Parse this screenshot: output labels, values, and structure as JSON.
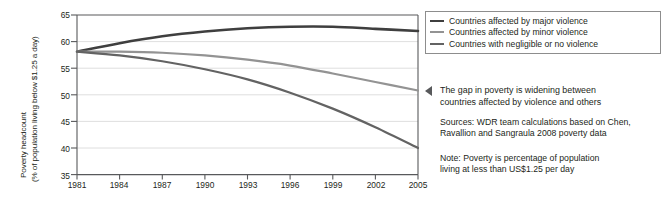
{
  "chart_data": {
    "type": "line",
    "title": "",
    "xlabel": "",
    "ylabel_line1": "Poverty headcount",
    "ylabel_line2": "(% of population living below $1.25 a day)",
    "xlim": [
      1981,
      2005
    ],
    "ylim": [
      35,
      65
    ],
    "grid": true,
    "legend_position": "top-right",
    "xticks": [
      "1981",
      "1984",
      "1987",
      "1990",
      "1993",
      "1996",
      "1999",
      "2002",
      "2005"
    ],
    "yticks": [
      "65",
      "60",
      "55",
      "50",
      "45",
      "40",
      "35"
    ],
    "x": [
      1981,
      1984,
      1987,
      1990,
      1993,
      1996,
      1999,
      2002,
      2005
    ],
    "series": [
      {
        "name": "Countries affected by major violence",
        "color": "#3f3f3f",
        "values": [
          58.1,
          59.7,
          61.0,
          61.9,
          62.5,
          62.8,
          62.8,
          62.4,
          62.0
        ]
      },
      {
        "name": "Countries affected by minor violence",
        "color": "#939393",
        "values": [
          58.1,
          58.1,
          57.9,
          57.4,
          56.6,
          55.5,
          54.0,
          52.4,
          50.8
        ]
      },
      {
        "name": "Countries with negligible or no violence",
        "color": "#636363",
        "values": [
          58.1,
          57.4,
          56.3,
          54.8,
          52.9,
          50.4,
          47.4,
          43.9,
          40.0
        ]
      }
    ]
  },
  "legend": {
    "items": [
      {
        "label": "Countries affected by major violence",
        "color": "#3f3f3f"
      },
      {
        "label": "Countries affected by minor violence",
        "color": "#939393"
      },
      {
        "label": "Countries with negligible or no violence",
        "color": "#636363"
      }
    ]
  },
  "annotations": {
    "callout_line1": "The gap in poverty is widening between",
    "callout_line2": "countries affected by violence and others",
    "sources_line1": "Sources: WDR team calculations based on Chen,",
    "sources_line2": "Ravallion and Sangraula 2008 poverty data",
    "note_line1": "Note: Poverty is percentage of population",
    "note_line2": "living at less than US$1.25 per day"
  },
  "colors": {
    "axis": "#58595b",
    "grid": "#d5d5d5",
    "text": "#231f20"
  }
}
